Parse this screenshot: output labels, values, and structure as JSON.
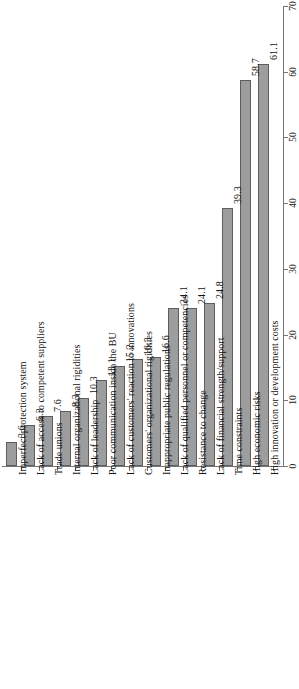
{
  "chart_data": {
    "type": "bar",
    "orientation": "vertical-bars-rotated-labels",
    "title": "",
    "subtitle": "",
    "xlabel": "",
    "ylabel": "",
    "ylim": [
      0,
      70
    ],
    "grid": false,
    "legend": null,
    "value_tick_labels": [
      "0",
      "10",
      "20",
      "30",
      "40",
      "50",
      "60",
      "70"
    ],
    "value_ticks": [
      0,
      10,
      20,
      30,
      40,
      50,
      60,
      70
    ],
    "bar_color": "#9d9d9d",
    "bar_edge_color": "#5e5e5e",
    "axis_color": "#767676",
    "categories": [
      "Imperfect protection system",
      "Lack of access to competent suppliers",
      "Trade unions",
      "Internal organizational rigidities",
      "Lack of leadership",
      "Poor communication inside the BU",
      "Lack of customers' reaction to innovations",
      "Customers' organizational rigidities",
      "Inappropriate public regulations",
      "Lack of qualified personnel or competencies",
      "Resistance to change",
      "Lack of financial strength/support",
      "Time constraints",
      "High economic risks",
      "High innovation or development costs"
    ],
    "values": [
      3.6,
      6.3,
      7.6,
      8.3,
      10.3,
      13.1,
      15.2,
      16.3,
      16.6,
      24.1,
      24.1,
      24.8,
      39.3,
      58.7,
      61.1
    ],
    "value_labels": [
      "3.6",
      "6.3",
      "7.6",
      "8.3",
      "10.3",
      "13.1",
      "15.2",
      "16.3",
      "16.6",
      "24.1",
      "24.1",
      "24.8",
      "39.3",
      "58.7",
      "61.1"
    ]
  }
}
